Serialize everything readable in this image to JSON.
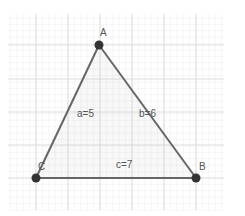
{
  "diagram": {
    "type": "geometry-triangle",
    "grid": {
      "major_x": [
        36,
        68,
        100,
        132,
        164,
        196
      ],
      "major_y": [
        45,
        79,
        112,
        145,
        178
      ],
      "x_range": [
        8,
        224
      ],
      "y_range": [
        14,
        210
      ],
      "minor_step": 6.4,
      "major_color": "#d9d9d9",
      "minor_color": "#f0f0f0"
    },
    "vertices": {
      "A": {
        "label": "A",
        "x": 99,
        "y": 45
      },
      "B": {
        "label": "B",
        "x": 196,
        "y": 178
      },
      "C": {
        "label": "C",
        "x": 36,
        "y": 178
      }
    },
    "sides": {
      "a": {
        "label": "a=5"
      },
      "b": {
        "label": "b=6"
      },
      "c": {
        "label": "c=7"
      }
    },
    "colors": {
      "stroke": "#666666",
      "vertex": "#333333",
      "fill": "rgba(200,200,200,0.12)",
      "label": "#555555"
    }
  }
}
